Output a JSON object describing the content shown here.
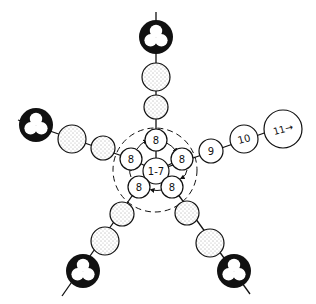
{
  "diagram": {
    "type": "radial-pentamer-branching",
    "center": {
      "label": "1-7"
    },
    "ring_nodes": [
      {
        "label": "8",
        "position": "top"
      },
      {
        "label": "8",
        "position": "upper-right"
      },
      {
        "label": "8",
        "position": "upper-left"
      },
      {
        "label": "8",
        "position": "lower-left"
      },
      {
        "label": "8",
        "position": "lower-right"
      }
    ],
    "right_arm": [
      {
        "label": "9"
      },
      {
        "label": "10"
      },
      {
        "label": "11→"
      }
    ],
    "stippled_arms": [
      "top",
      "left",
      "lower-left",
      "lower-right"
    ],
    "terminal_symbol": "black circle with white trefoil",
    "dashed_ring": true,
    "rotation_arrows": "clockwise arrows between ring nodes",
    "colors": {
      "line": "#111111",
      "fill_black": "#111111",
      "fill_white": "#ffffff"
    }
  }
}
